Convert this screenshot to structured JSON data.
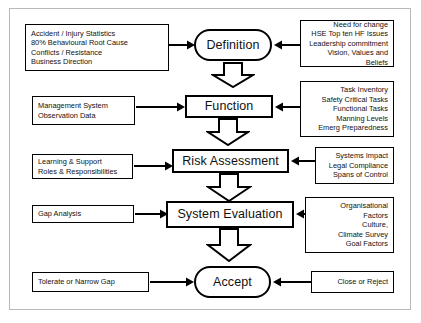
{
  "diagram": {
    "colors": {
      "line": "#000000",
      "frame": "#b9b9b9",
      "background": "#ffffff",
      "text": "#111111"
    },
    "stages": [
      {
        "id": "definition",
        "label": "Definition",
        "shape": "rounded-terminator",
        "left_input": "Accident / Injury Statistics\n80% Behavioural Root Cause\nConflicts / Resistance\nBusiness Direction",
        "right_input": "Need for change\nHSE Top ten HF Issues\nLeadership commitment\nVision, Values and Beliefs"
      },
      {
        "id": "function",
        "label": "Function",
        "shape": "rectangle",
        "left_input": "Management System\nObservation Data",
        "right_input": "Task Inventory\nSafety Critical Tasks\nFunctional Tasks\nManning Levels\nEmerg Preparedness"
      },
      {
        "id": "risk-assessment",
        "label": "Risk Assessment",
        "shape": "rectangle",
        "left_input": "Learning & Support\nRoles & Responsibilities",
        "right_input": "Systems Impact\nLegal Compliance\nSpans of Control"
      },
      {
        "id": "system-evaluation",
        "label": "System Evaluation",
        "shape": "rectangle",
        "left_input": "Gap Analysis",
        "right_input": "Organisational\nFactors\nCulture,\nClimate Survey\nGoal Factors"
      },
      {
        "id": "accept",
        "label": "Accept",
        "shape": "rounded-terminator",
        "left_input": "Tolerate or Narrow Gap",
        "right_input": "Close or Reject"
      }
    ],
    "flow_arrows": [
      {
        "name": "definition-to-function",
        "direction": "down"
      },
      {
        "name": "function-to-risk-assessment",
        "direction": "down"
      },
      {
        "name": "risk-assessment-to-system-evaluation",
        "direction": "down"
      },
      {
        "name": "system-evaluation-to-accept",
        "direction": "down"
      }
    ]
  }
}
